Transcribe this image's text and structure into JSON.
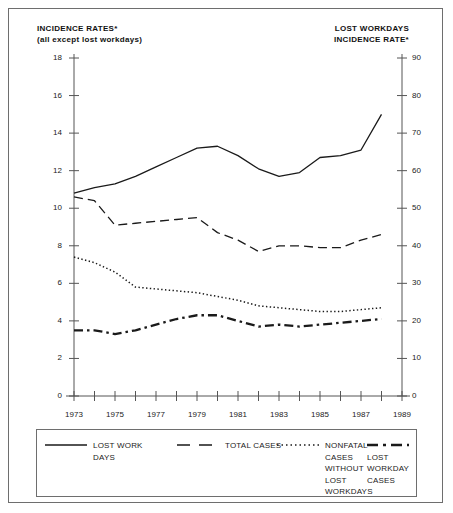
{
  "header": {
    "left_line1": "INCIDENCE RATES*",
    "left_line2": "(all except lost workdays)",
    "right_line1": "LOST WORKDAYS",
    "right_line2": "INCIDENCE RATE*"
  },
  "chart_data": {
    "type": "line",
    "title": "",
    "subtitle": "",
    "xlabel": "",
    "ylabel": "INCIDENCE RATES* (all except lost workdays)",
    "y2label": "LOST WORKDAYS INCIDENCE RATE*",
    "x": [
      1973,
      1974,
      1975,
      1976,
      1977,
      1978,
      1979,
      1980,
      1981,
      1982,
      1983,
      1984,
      1985,
      1986,
      1987,
      1988
    ],
    "xlim": [
      1973,
      1989
    ],
    "xticks": [
      1973,
      1974,
      1975,
      1976,
      1977,
      1978,
      1979,
      1980,
      1981,
      1982,
      1983,
      1984,
      1985,
      1986,
      1987,
      1988,
      1989
    ],
    "xticklabels": [
      "1973",
      "",
      "1975",
      "",
      "1977",
      "",
      "1979",
      "",
      "1981",
      "",
      "1983",
      "",
      "1985",
      "",
      "1987",
      "",
      "1989"
    ],
    "ylim": [
      0,
      18
    ],
    "yticks": [
      0,
      2,
      4,
      6,
      8,
      10,
      12,
      14,
      16,
      18
    ],
    "yticklabels": [
      "0",
      "2",
      "4",
      "6",
      "8",
      "10",
      "12",
      "14",
      "16",
      "18"
    ],
    "y2lim": [
      0,
      90
    ],
    "y2ticks": [
      0,
      10,
      20,
      30,
      40,
      50,
      60,
      70,
      80,
      90
    ],
    "y2ticklabels": [
      "0",
      "10",
      "20",
      "30",
      "40",
      "50",
      "60",
      "70",
      "80",
      "90"
    ],
    "grid": false,
    "legend_position": "below",
    "series": [
      {
        "name": "LOST WORK DAYS",
        "legend_label_line1": "LOST WORK",
        "legend_label_line2": "DAYS",
        "style": "solid",
        "axis": "right",
        "values_right_axis": [
          54.0,
          55.5,
          56.5,
          58.5,
          61.0,
          63.5,
          66.0,
          66.5,
          64.0,
          60.5,
          58.5,
          59.5,
          63.5,
          64.0,
          65.5,
          75.0
        ],
        "values_left_scale": [
          10.8,
          11.1,
          11.3,
          11.7,
          12.2,
          12.7,
          13.2,
          13.3,
          12.8,
          12.1,
          11.7,
          11.9,
          12.7,
          12.8,
          13.1,
          15.0
        ]
      },
      {
        "name": "TOTAL CASES",
        "legend_label_line1": "TOTAL CASES",
        "legend_label_line2": "",
        "style": "dashed",
        "axis": "left",
        "values": [
          10.6,
          10.4,
          9.1,
          9.2,
          9.3,
          9.4,
          9.5,
          8.7,
          8.3,
          7.7,
          8.0,
          8.0,
          7.9,
          7.9,
          8.3,
          8.6
        ]
      },
      {
        "name": "NONFATAL CASES WITHOUT LOST WORKDAYS",
        "legend_label_line1": "NONFATAL",
        "legend_label_line2": "CASES",
        "legend_label_line3": "WITHOUT",
        "legend_label_line4": "LOST",
        "legend_label_line5": "WORKDAYS",
        "style": "dotted",
        "axis": "left",
        "values": [
          7.4,
          7.1,
          6.6,
          5.8,
          5.7,
          5.6,
          5.5,
          5.3,
          5.1,
          4.8,
          4.7,
          4.6,
          4.5,
          4.5,
          4.6,
          4.7
        ]
      },
      {
        "name": "LOST WORKDAY CASES",
        "legend_label_line1": "LOST",
        "legend_label_line2": "WORKDAY",
        "legend_label_line3": "CASES",
        "style": "dashdot",
        "axis": "left",
        "values": [
          3.5,
          3.5,
          3.3,
          3.5,
          3.8,
          4.1,
          4.3,
          4.3,
          4.0,
          3.7,
          3.8,
          3.7,
          3.8,
          3.9,
          4.0,
          4.1
        ]
      }
    ]
  },
  "colors": {
    "line": "#1a1a1a",
    "axis": "#555555",
    "text": "#222222",
    "border": "#6e6e6e"
  }
}
